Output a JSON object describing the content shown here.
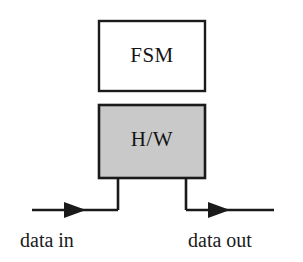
{
  "diagram": {
    "background_color": "#ffffff",
    "stroke_color": "#1a1a1a",
    "blocks": [
      {
        "id": "fsm",
        "label": "FSM",
        "fill_color": "#ffffff",
        "x": 99,
        "y": 21,
        "width": 106,
        "height": 70
      },
      {
        "id": "hw",
        "label": "H/W",
        "fill_color": "#c9c9c9",
        "x": 99,
        "y": 105,
        "width": 106,
        "height": 73
      }
    ],
    "signals": [
      {
        "id": "data-in",
        "label": "data in",
        "direction": "in",
        "arrow_x": 80,
        "line_y": 210
      },
      {
        "id": "data-out",
        "label": "data out",
        "direction": "out",
        "arrow_x": 225,
        "line_y": 210
      }
    ],
    "connectors": [
      {
        "id": "hw-in-drop",
        "x": 118,
        "from_y": 178,
        "to_y": 210
      },
      {
        "id": "hw-out-drop",
        "x": 186,
        "from_y": 178,
        "to_y": 210
      }
    ]
  }
}
